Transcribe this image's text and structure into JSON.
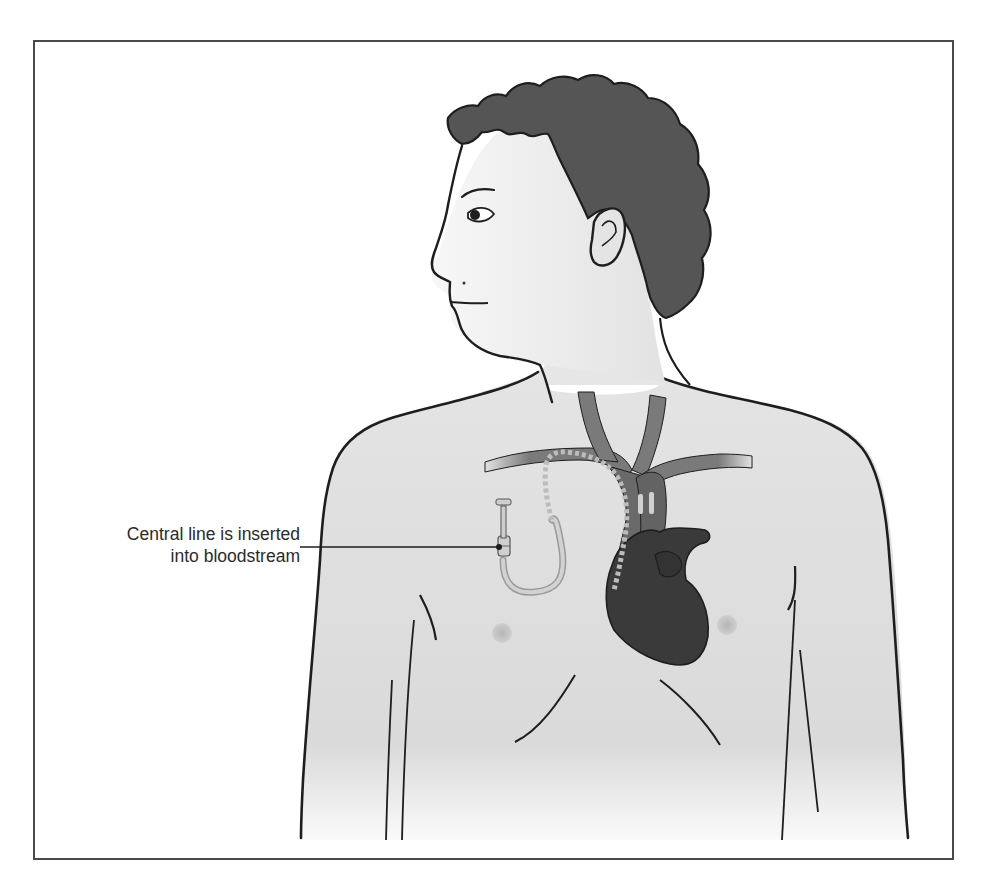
{
  "figure": {
    "callout": {
      "line1": "Central line is inserted",
      "line2": "into bloodstream"
    }
  },
  "colors": {
    "frame": "#4a4a4a",
    "outline": "#1e1e1e",
    "skin": "#ededed",
    "skin_shadow": "#d6d6d6",
    "hair": "#555555",
    "vein": "#7a7a7a",
    "vein_dark": "#636363",
    "heart": "#3a3a3a",
    "catheter": "#c9c9c9",
    "nipple": "#c4c4c4",
    "text": "#2b2b2b"
  }
}
